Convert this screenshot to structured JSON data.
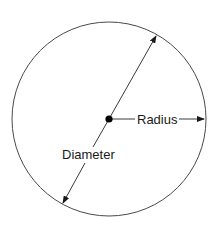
{
  "diagram": {
    "type": "circle-anatomy",
    "labels": {
      "radius": "Radius",
      "diameter": "Diameter"
    },
    "colors": {
      "stroke": "#3a3a3a",
      "text": "#1a1a1a",
      "background": "#ffffff"
    },
    "circle": {
      "cx": 109,
      "cy": 119,
      "r": 97
    },
    "center_point": {
      "x": 109,
      "y": 119
    },
    "diameter_line": {
      "x1": 62,
      "y1": 205,
      "x2": 157,
      "y2": 34
    },
    "radius_line": {
      "x1": 109,
      "y1": 119,
      "x2": 205,
      "y2": 119
    }
  }
}
